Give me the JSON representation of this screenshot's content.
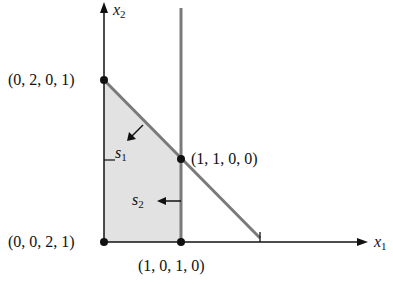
{
  "diagram": {
    "type": "linear-programming-feasible-region",
    "axes": {
      "x_label": "x",
      "x_sub": "1",
      "y_label": "x",
      "y_sub": "2"
    },
    "vertices": [
      {
        "id": "origin",
        "label": "(0, 0, 2, 1)"
      },
      {
        "id": "top",
        "label": "(0, 2, 0, 1)"
      },
      {
        "id": "corner",
        "label": "(1, 1, 0, 0)"
      },
      {
        "id": "bottom-right",
        "label": "(1, 0, 1, 0)"
      }
    ],
    "slack_labels": [
      {
        "id": "s1",
        "name": "s",
        "sub": "1"
      },
      {
        "id": "s2",
        "name": "s",
        "sub": "2"
      }
    ],
    "colors": {
      "region_fill": "#e2e2e2",
      "constraint_line": "#7a7a7a",
      "axis": "#111111",
      "vertex": "#111111"
    }
  }
}
